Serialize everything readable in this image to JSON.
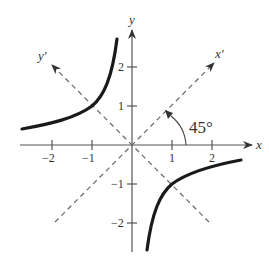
{
  "diagram": {
    "type": "rotated-axes-hyperbola",
    "axes": {
      "x_label": "x",
      "y_label": "y",
      "rotated_x_label": "x′",
      "rotated_y_label": "y′",
      "x_ticks": [
        {
          "value": -2,
          "label": "−2"
        },
        {
          "value": -1,
          "label": "−1"
        },
        {
          "value": 1,
          "label": "1"
        },
        {
          "value": 2,
          "label": "2"
        }
      ],
      "y_ticks": [
        {
          "value": 2,
          "label": "2"
        },
        {
          "value": 1,
          "label": "1"
        },
        {
          "value": -1,
          "label": "−1"
        },
        {
          "value": -2,
          "label": "−2"
        }
      ]
    },
    "angle_label": "45°",
    "curve": {
      "description": "hyperbola xy = -1, two branches in quadrants II and IV",
      "branches": [
        "upper-left",
        "lower-right"
      ]
    }
  }
}
